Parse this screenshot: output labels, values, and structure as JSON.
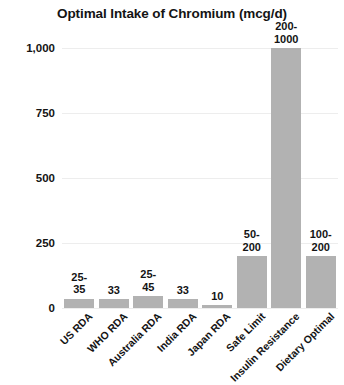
{
  "chart_data": {
    "type": "bar",
    "title": "Optimal Intake of Chromium (mcg/d)",
    "xlabel": "",
    "ylabel": "",
    "ylim": [
      0,
      1000
    ],
    "grid": true,
    "legend": "none",
    "categories": [
      "US RDA",
      "WHO RDA",
      "Australia RDA",
      "India RDA",
      "Japan RDA",
      "Safe Limit",
      "Insulin Resistance",
      "Dietary Optimal"
    ],
    "values": [
      35,
      33,
      45,
      33,
      10,
      200,
      1000,
      200
    ],
    "value_labels": [
      "25-\n35",
      "33",
      "25-\n45",
      "33",
      "10",
      "50-\n200",
      "200-\n1000",
      "100-\n200"
    ],
    "ranges": [
      {
        "low": 25,
        "high": 35
      },
      {
        "low": 33,
        "high": 33
      },
      {
        "low": 25,
        "high": 45
      },
      {
        "low": 33,
        "high": 33
      },
      {
        "low": 10,
        "high": 10
      },
      {
        "low": 50,
        "high": 200
      },
      {
        "low": 200,
        "high": 1000
      },
      {
        "low": 100,
        "high": 200
      }
    ],
    "y_ticks": [
      0,
      250,
      500,
      750,
      1000
    ],
    "y_tick_labels": [
      "0",
      "250",
      "500",
      "750",
      "1,000"
    ],
    "bar_color": "#b2b2b2",
    "grid_color": "#ededed",
    "text_color": "#141414"
  }
}
